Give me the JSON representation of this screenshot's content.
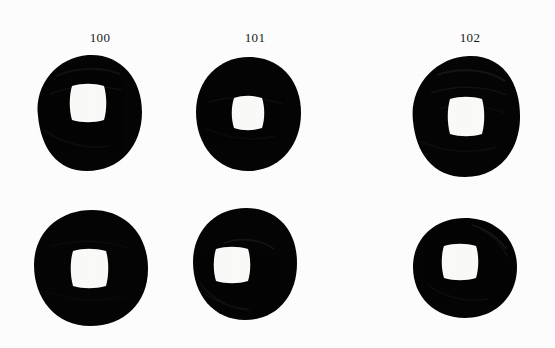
{
  "plate": {
    "kind": "photographic-plate",
    "subject": "ancient chinese cash coins",
    "background_color": "#fefefe",
    "coin_color": "#050505",
    "hole_color": "#fbfbf9",
    "rows": 2,
    "columns": 3,
    "coin_count": 6
  },
  "labels": [
    {
      "text": "100",
      "x": 80,
      "y": 31,
      "width": 40
    },
    {
      "text": "101",
      "x": 235,
      "y": 31,
      "width": 40
    },
    {
      "text": "102",
      "x": 450,
      "y": 31,
      "width": 40
    }
  ],
  "coins": [
    {
      "id": "coin-100-top",
      "catalog": "100",
      "row": 1,
      "column": 1,
      "left": 30,
      "top": 50,
      "width": 115,
      "height": 125,
      "hole_left": 30,
      "hole_top": 34,
      "hole_width": 33,
      "hole_height": 34
    },
    {
      "id": "coin-101-top",
      "catalog": "101",
      "row": 1,
      "column": 2,
      "left": 191,
      "top": 54,
      "width": 114,
      "height": 120,
      "hole_left": 30,
      "hole_top": 42,
      "hole_width": 32,
      "hole_height": 32
    },
    {
      "id": "coin-102-top",
      "catalog": "102",
      "row": 1,
      "column": 3,
      "left": 407,
      "top": 51,
      "width": 117,
      "height": 130,
      "hole_left": 40,
      "hole_top": 44,
      "hole_width": 35,
      "hole_height": 37
    },
    {
      "id": "coin-100-bottom",
      "catalog": "100",
      "row": 2,
      "column": 1,
      "left": 30,
      "top": 207,
      "width": 122,
      "height": 122,
      "hole_left": 40,
      "hole_top": 41,
      "hole_width": 35,
      "hole_height": 37
    },
    {
      "id": "coin-101-bottom",
      "catalog": "101",
      "row": 2,
      "column": 2,
      "left": 190,
      "top": 205,
      "width": 110,
      "height": 118,
      "hole_left": 25,
      "hole_top": 41,
      "hole_width": 34,
      "hole_height": 35
    },
    {
      "id": "coin-102-bottom",
      "catalog": "102",
      "row": 2,
      "column": 3,
      "left": 410,
      "top": 215,
      "width": 110,
      "height": 106,
      "hole_left": 33,
      "hole_top": 28,
      "hole_width": 35,
      "hole_height": 36
    }
  ]
}
